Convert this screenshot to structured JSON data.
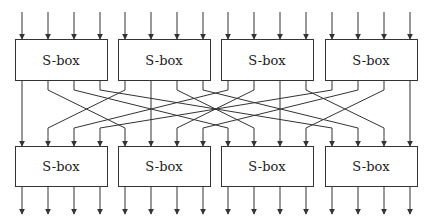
{
  "diagram": {
    "type": "substitution-permutation network",
    "box_label": "S-box",
    "top_row": [
      {
        "label": "S-box"
      },
      {
        "label": "S-box"
      },
      {
        "label": "S-box"
      },
      {
        "label": "S-box"
      }
    ],
    "bottom_row": [
      {
        "label": "S-box"
      },
      {
        "label": "S-box"
      },
      {
        "label": "S-box"
      },
      {
        "label": "S-box"
      }
    ],
    "bits_per_box": 4,
    "permutation": "output bit j of top S-box i connects to input bit i of bottom S-box j",
    "colors": {
      "stroke": "#333333",
      "background": "#ffffff"
    }
  }
}
